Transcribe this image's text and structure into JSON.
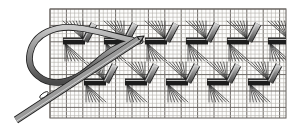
{
  "figure": {
    "background_color": "#ffffff",
    "width": 297,
    "height": 128
  },
  "canvas_grid": {
    "name": "even-weave fabric grid",
    "x": 50,
    "y": 9,
    "width": 236,
    "height": 109,
    "fine_cell": 4.1,
    "fine_line_color": "#b4b0ab",
    "fine_line_width": 0.6,
    "heavy_every": 4,
    "heavy_line_color": "#6e6a66",
    "heavy_line_width": 1.0,
    "border_color": "#6e6a66",
    "fill_color": "#fdfdfc"
  },
  "palette": {
    "thread_outline": "#1c1c1c",
    "thread_fill": "#8d8d8d",
    "thread_highlight": "#d3d3d3",
    "thin_thread": "#2a2a2a",
    "needle_outline": "#1c1c1c",
    "needle_fill": "#9a9a9a",
    "loop_outline": "#1f1f1f",
    "loop_fill": "#8a8a8a"
  },
  "stitch_rows": [
    {
      "name": "upper-stitch-row",
      "label": "upper row of completed stitch units",
      "baseline_y": 41,
      "bar_half_width": 11,
      "riser_rise": 17,
      "riser_run": 9,
      "thread_width": 5.4,
      "units": [
        {
          "index": 0,
          "bar_center_x": 74,
          "has_bar": true,
          "has_riser": true
        },
        {
          "index": 1,
          "bar_center_x": 115,
          "has_bar": true,
          "has_riser": true
        },
        {
          "index": 2,
          "bar_center_x": 156,
          "has_bar": true,
          "has_riser": true
        },
        {
          "index": 3,
          "bar_center_x": 197,
          "has_bar": true,
          "has_riser": true
        },
        {
          "index": 4,
          "bar_center_x": 238,
          "has_bar": true,
          "has_riser": true
        },
        {
          "index": 5,
          "bar_center_x": 279,
          "has_bar": true,
          "has_riser": true
        }
      ]
    },
    {
      "name": "lower-stitch-row",
      "label": "lower row of completed stitch units",
      "baseline_y": 82,
      "bar_half_width": 11,
      "riser_rise": 17,
      "riser_run": 9,
      "thread_width": 5.4,
      "units": [
        {
          "index": 0,
          "bar_center_x": 95,
          "has_bar": true,
          "has_riser": true
        },
        {
          "index": 1,
          "bar_center_x": 136,
          "has_bar": true,
          "has_riser": true
        },
        {
          "index": 2,
          "bar_center_x": 177,
          "has_bar": true,
          "has_riser": true
        },
        {
          "index": 3,
          "bar_center_x": 218,
          "has_bar": true,
          "has_riser": true
        },
        {
          "index": 4,
          "bar_center_x": 259,
          "has_bar": true,
          "has_riser": true
        }
      ]
    }
  ],
  "fan_lines": {
    "name": "thin foundation threads",
    "color": "#2a2a2a",
    "width": 0.7,
    "rays_per_fan": 7,
    "spread": 10,
    "drop": 20
  },
  "needle": {
    "name": "tapestry needle",
    "label": "blunt tapestry needle passing under the worked band",
    "tip_x": 144,
    "tip_y": 36,
    "tail_x": 16,
    "tail_y": 120,
    "body_width": 5.8,
    "eye_cx": 44,
    "eye_cy": 95,
    "eye_rx": 2.0,
    "eye_ry": 5.0,
    "outline_color": "#1c1c1c",
    "fill_color": "#9a9a9a"
  },
  "working_thread": {
    "name": "working thread loop",
    "label": "loop of working thread trailing from the needle eye",
    "width": 5.0,
    "outline_color": "#1f1f1f",
    "fill_color": "#8a8a8a",
    "path": "M 132 40 C 112 36, 96 30, 78 28 C 56 25, 34 33, 30 53 C 26 72, 44 85, 62 82 C 80 79, 92 66, 104 56 C 116 46, 128 42, 140 41"
  },
  "legend": {
    "visible": false,
    "entries": [
      {
        "swatch": "#8d8d8d",
        "label": "worked thread"
      },
      {
        "swatch": "#b4b0ab",
        "label": "canvas threads"
      },
      {
        "swatch": "#9a9a9a",
        "label": "needle"
      }
    ]
  }
}
